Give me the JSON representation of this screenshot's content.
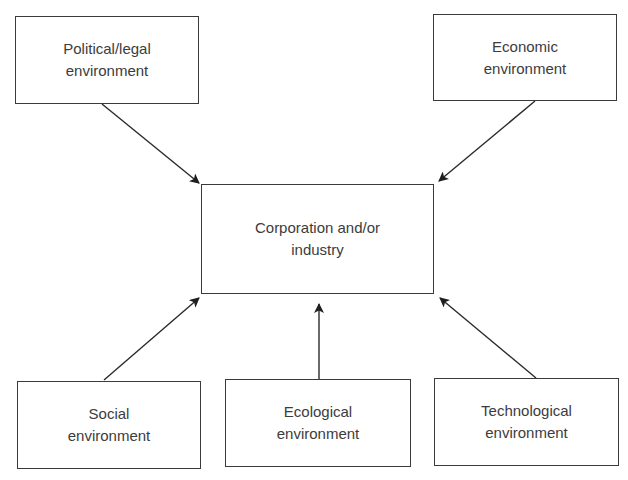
{
  "diagram": {
    "center": {
      "label": "Corporation and/or\nindustry"
    },
    "nodes": [
      {
        "id": "political",
        "label": "Political/legal\nenvironment"
      },
      {
        "id": "economic",
        "label": "Economic\nenvironment"
      },
      {
        "id": "social",
        "label": "Social\nenvironment"
      },
      {
        "id": "ecological",
        "label": "Ecological\nenvironment"
      },
      {
        "id": "technological",
        "label": "Technological\nenvironment"
      }
    ],
    "edges": [
      {
        "from": "political",
        "to": "center"
      },
      {
        "from": "economic",
        "to": "center"
      },
      {
        "from": "social",
        "to": "center"
      },
      {
        "from": "ecological",
        "to": "center"
      },
      {
        "from": "technological",
        "to": "center"
      }
    ],
    "line_color": "#2a2a2a"
  }
}
